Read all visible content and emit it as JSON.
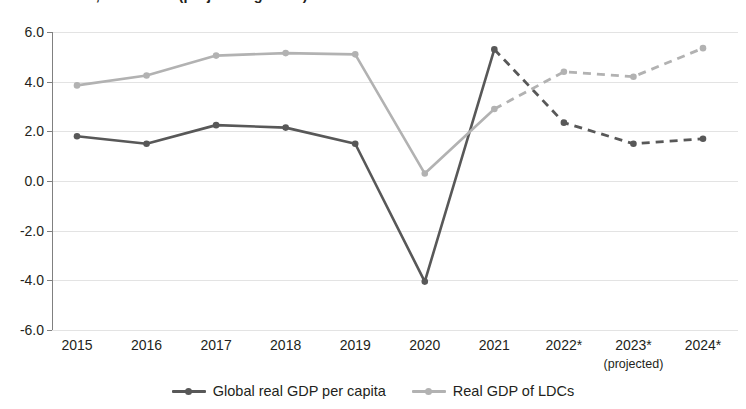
{
  "chart_data": {
    "type": "line",
    "title": "GDP of LDCs, 2015-2024 (projected growth)",
    "xlabel": "",
    "ylabel": "",
    "ylim": [
      -6.0,
      6.0
    ],
    "grid": true,
    "legend_position": "bottom-center",
    "categories": [
      "2015",
      "2016",
      "2017",
      "2018",
      "2019",
      "2020",
      "2021",
      "2022*",
      "2023*",
      "2024*"
    ],
    "x_note": "(projected)",
    "x_note_under": "2023*",
    "y_ticks": [
      "6.0",
      "4.0",
      "2.0",
      "0.0",
      "-2.0",
      "-4.0",
      "-6.0"
    ],
    "y_tick_values": [
      6.0,
      4.0,
      2.0,
      0.0,
      -2.0,
      -4.0,
      -6.0
    ],
    "projected_from_index": 6,
    "series": [
      {
        "name": "Global real GDP per capita",
        "color": "#585858",
        "values": [
          1.8,
          1.5,
          2.25,
          2.15,
          1.5,
          -4.05,
          5.3,
          2.35,
          1.5,
          1.7
        ]
      },
      {
        "name": "Real GDP of LDCs",
        "color": "#b2b2b2",
        "values": [
          3.85,
          4.25,
          5.05,
          5.15,
          5.1,
          0.3,
          2.9,
          4.4,
          4.2,
          5.35
        ]
      }
    ]
  },
  "legend": {
    "items": [
      {
        "label": "Global real GDP per capita",
        "color": "#585858"
      },
      {
        "label": "Real GDP of LDCs",
        "color": "#b2b2b2"
      }
    ]
  }
}
